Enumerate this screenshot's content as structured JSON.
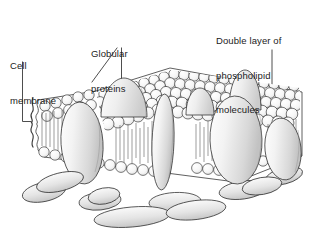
{
  "figure": {
    "style": "black and white pen-and-ink scientific illustration",
    "background_color": "#ffffff",
    "ink_color": "#1b1b1b",
    "shade_light": "#f2f2f2",
    "shade_mid": "#dcdcdc",
    "shade_dark": "#bfbfbf"
  },
  "labels": {
    "cell_membrane": {
      "line1": "Cell",
      "line2": "membrane",
      "full_text": "Cell membrane",
      "pointer": "vertical leader line down to a wavy brace on the cut left edge of the membrane"
    },
    "globular_proteins": {
      "line1": "Globular",
      "line2": "proteins",
      "full_text": "Globular proteins",
      "pointer": "two leader lines fanning down-left and down to embedded protein ovals"
    },
    "double_layer": {
      "line1": "Double layer of",
      "line2": "phospholipid",
      "line3": "molecules",
      "full_text": "Double layer of phospholipid molecules",
      "pointer": "vertical leader line down to a square bracket spanning the bilayer thickness on the right edge"
    }
  },
  "structures": {
    "phospholipid_heads": "rows of small circles forming the outer and inner membrane surfaces",
    "phospholipid_tails": "short vertical hatch lines between the two head layers",
    "globular_proteins": "large shaded ovals and domes spanning or embedded in the bilayer",
    "peripheral_proteins": "elongated sausage shapes attached below the inner surface",
    "cut_edge": "wavy torn edge at the left showing the membrane in cross section"
  }
}
